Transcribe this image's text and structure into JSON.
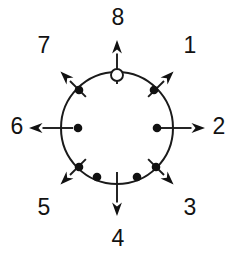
{
  "figure": {
    "name": "radial-direction-diagram",
    "background_color": "#ffffff",
    "line_color": "#1a1a1a",
    "marker_fill_color": "#111111",
    "open_marker_fill_color": "#ffffff",
    "canvas": {
      "width": 237,
      "height": 259
    },
    "circle": {
      "cx": 117,
      "cy": 128,
      "r": 56
    },
    "direction_labels": [
      {
        "id": "1",
        "text": "1",
        "x": 190,
        "y": 47,
        "angle_deg": 45
      },
      {
        "id": "2",
        "text": "2",
        "x": 219,
        "y": 128,
        "angle_deg": 0
      },
      {
        "id": "3",
        "text": "3",
        "x": 190,
        "y": 209,
        "angle_deg": -45
      },
      {
        "id": "4",
        "text": "4",
        "x": 118,
        "y": 240,
        "angle_deg": -90
      },
      {
        "id": "5",
        "text": "5",
        "x": 44,
        "y": 209,
        "angle_deg": -135
      },
      {
        "id": "6",
        "text": "6",
        "x": 17,
        "y": 128,
        "angle_deg": 180
      },
      {
        "id": "7",
        "text": "7",
        "x": 44,
        "y": 47,
        "angle_deg": 135
      },
      {
        "id": "8",
        "text": "8",
        "x": 118,
        "y": 19,
        "angle_deg": 90
      }
    ],
    "arrows": [
      {
        "id": "arrow-1",
        "angle_deg": 45,
        "start_r": 44,
        "end_r": 80
      },
      {
        "id": "arrow-2",
        "angle_deg": 0,
        "start_r": 44,
        "end_r": 88
      },
      {
        "id": "arrow-3",
        "angle_deg": -45,
        "start_r": 44,
        "end_r": 80
      },
      {
        "id": "arrow-4",
        "angle_deg": -90,
        "start_r": 44,
        "end_r": 88
      },
      {
        "id": "arrow-5",
        "angle_deg": -135,
        "start_r": 44,
        "end_r": 80
      },
      {
        "id": "arrow-6",
        "angle_deg": 180,
        "start_r": 44,
        "end_r": 88
      },
      {
        "id": "arrow-7",
        "angle_deg": 135,
        "start_r": 44,
        "end_r": 80
      },
      {
        "id": "arrow-8",
        "angle_deg": 90,
        "start_r": 44,
        "end_r": 88
      }
    ],
    "markers": [
      {
        "id": "marker-top",
        "type": "open",
        "x": 117,
        "y": 75,
        "r": 6.0
      },
      {
        "id": "marker-upper-right",
        "type": "filled",
        "x": 154,
        "y": 90,
        "r": 4.3
      },
      {
        "id": "marker-right",
        "type": "filled",
        "x": 157,
        "y": 128,
        "r": 4.3
      },
      {
        "id": "marker-lower-right",
        "type": "filled",
        "x": 156,
        "y": 167,
        "r": 4.3
      },
      {
        "id": "marker-bottom-right",
        "type": "filled",
        "x": 137,
        "y": 177,
        "r": 4.3
      },
      {
        "id": "marker-bottom-left",
        "type": "filled",
        "x": 97,
        "y": 177,
        "r": 4.3
      },
      {
        "id": "marker-lower-left",
        "type": "filled",
        "x": 79,
        "y": 167,
        "r": 4.3
      },
      {
        "id": "marker-left",
        "type": "filled",
        "x": 78,
        "y": 128,
        "r": 4.3
      },
      {
        "id": "marker-upper-left",
        "type": "filled",
        "x": 79,
        "y": 90,
        "r": 4.3
      }
    ]
  }
}
